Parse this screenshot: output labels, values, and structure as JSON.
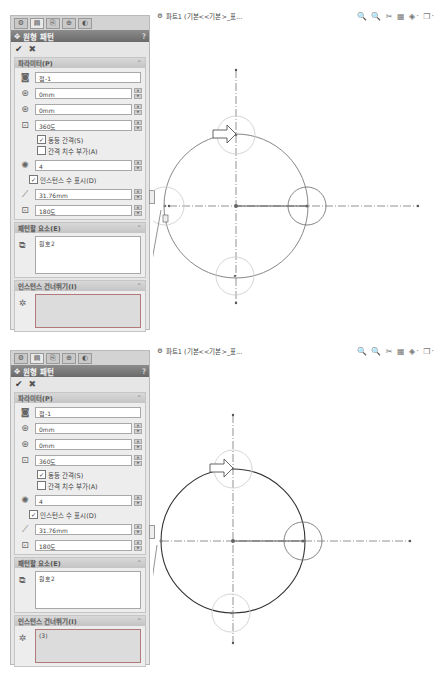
{
  "screens": [
    {
      "id": "before",
      "tabs": [
        "feature-manager-icon",
        "property-manager-icon",
        "configuration-manager-icon",
        "dimxpert-icon",
        "display-manager-icon"
      ],
      "panel": {
        "title": "원형 패턴",
        "help": "?",
        "ok_icon": "✔",
        "cancel_icon": "✖",
        "parameters": {
          "header": "파라미터(P)",
          "direction_value": "점-1",
          "x_value": "0mm",
          "y_value": "0mm",
          "angle_value": "360도",
          "equal_spacing_label": "동등 간격(S)",
          "equal_spacing_checked": true,
          "add_spacing_dim_label": "간격 치수 부가(A)",
          "add_spacing_dim_checked": false,
          "instances_value": "4",
          "show_instance_count_label": "인스턴스 수 표시(D)",
          "show_instance_count_checked": true,
          "radius_value": "31.76mm",
          "arc_angle_value": "180도"
        },
        "entities": {
          "header": "패턴할 요소(E)",
          "items": [
            "원호2"
          ]
        },
        "skip": {
          "header": "인스턴스 건너뛰기(I)",
          "items": []
        }
      },
      "canvas": {
        "doc_title": "파트1 (기본<<기본>_표...",
        "toolbar_icons": "🔍 🔍 ✂ ▦ ◈· ❒·",
        "axis_label": "Y"
      }
    },
    {
      "id": "after",
      "tabs": [
        "feature-manager-icon",
        "property-manager-icon",
        "configuration-manager-icon",
        "dimxpert-icon",
        "display-manager-icon"
      ],
      "panel": {
        "title": "원형 패턴",
        "help": "?",
        "ok_icon": "✔",
        "cancel_icon": "✖",
        "parameters": {
          "header": "파라미터(P)",
          "direction_value": "점-1",
          "x_value": "0mm",
          "y_value": "0mm",
          "angle_value": "360도",
          "equal_spacing_label": "동등 간격(S)",
          "equal_spacing_checked": true,
          "add_spacing_dim_label": "간격 치수 부가(A)",
          "add_spacing_dim_checked": false,
          "instances_value": "4",
          "show_instance_count_label": "인스턴스 수 표시(D)",
          "show_instance_count_checked": true,
          "radius_value": "31.76mm",
          "arc_angle_value": "180도"
        },
        "entities": {
          "header": "패턴할 요소(E)",
          "items": [
            "원호2"
          ]
        },
        "skip": {
          "header": "인스턴스 건너뛰기(I)",
          "items": [
            "(3)"
          ]
        }
      },
      "canvas": {
        "doc_title": "파트1 (기본<<기본>_표...",
        "toolbar_icons": "🔍 🔍 ✂ ▦ ◈· ❒·",
        "axis_label": "Y"
      }
    }
  ],
  "colors": {
    "title_bar": "#7a7a7a",
    "panel_bg": "#e6e6e6",
    "skip_box_border": "#b07a7a",
    "sketch_line": "#555555",
    "pattern_circle": "#c8c8c8"
  }
}
